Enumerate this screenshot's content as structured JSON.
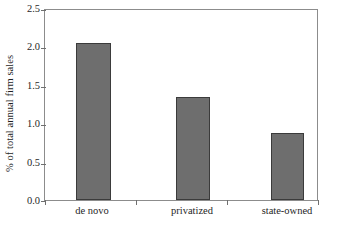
{
  "chart_data": {
    "type": "bar",
    "title": "",
    "subtitle": "",
    "xlabel": "",
    "ylabel": "% of total annual firm sales",
    "categories": [
      "de novo",
      "privatized",
      "state-owned"
    ],
    "values": [
      2.07,
      1.35,
      0.88
    ],
    "series": [
      {
        "name": "% of total annual firm sales",
        "values": [
          2.07,
          1.35,
          0.88
        ]
      }
    ],
    "ylim": [
      0.0,
      2.5
    ],
    "y_ticks": [
      0.0,
      0.5,
      1.0,
      1.5,
      2.0,
      2.5
    ],
    "y_tick_labels": [
      "0.0",
      "0.5",
      "1.0",
      "1.5",
      "2.0",
      "2.5"
    ],
    "grid": false,
    "legend": null,
    "legend_position": "none",
    "annotations": [],
    "colors": {
      "bar_fill": "#6e6e6e",
      "bar_edge": "#3b3b3b",
      "axis": "#8c8c8c",
      "tick": "#6f6f6f",
      "text": "#1f1f1f",
      "background": "#ffffff"
    }
  }
}
